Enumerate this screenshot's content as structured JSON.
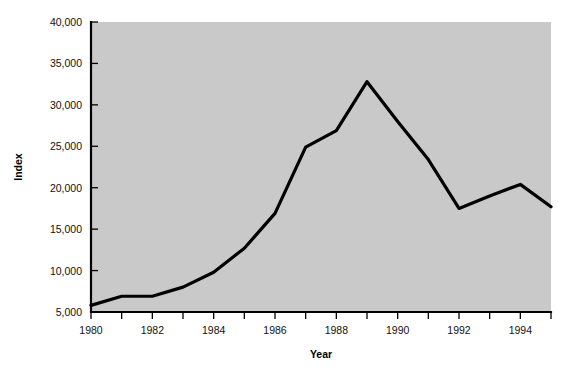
{
  "chart_data": {
    "type": "line",
    "title": "",
    "xlabel": "Year",
    "ylabel": "Index",
    "x": [
      1980,
      1981,
      1982,
      1983,
      1984,
      1985,
      1986,
      1987,
      1988,
      1989,
      1990,
      1991,
      1992,
      1993,
      1994,
      1995
    ],
    "values": [
      5800,
      6900,
      6900,
      8000,
      9800,
      12700,
      16900,
      24900,
      26900,
      32800,
      28000,
      23400,
      17500,
      19000,
      20400,
      17700
    ],
    "series": [
      {
        "name": "Index",
        "values": [
          5800,
          6900,
          6900,
          8000,
          9800,
          12700,
          16900,
          24900,
          26900,
          32800,
          28000,
          23400,
          17500,
          19000,
          20400,
          17700
        ]
      }
    ],
    "xlim": [
      1980,
      1995
    ],
    "ylim": [
      5000,
      40000
    ],
    "ytick_values": [
      5000,
      10000,
      15000,
      20000,
      25000,
      30000,
      35000,
      40000
    ],
    "ytick_labels": [
      "5,000",
      "10,000",
      "15,000",
      "20,000",
      "25,000",
      "30,000",
      "35,000",
      "40,000"
    ],
    "xtick_values": [
      1980,
      1981,
      1982,
      1983,
      1984,
      1985,
      1986,
      1987,
      1988,
      1989,
      1990,
      1991,
      1992,
      1993,
      1994,
      1995
    ],
    "xtick_labels": [
      "1980",
      "",
      "1982",
      "",
      "1984",
      "",
      "1986",
      "",
      "1988",
      "",
      "1990",
      "",
      "1992",
      "",
      "1994",
      ""
    ],
    "grid": false,
    "legend": false,
    "legend_position": "none",
    "plot_background_color": "#c9c9c9",
    "line_color": "#000000",
    "figure_background_color": "#ffffff"
  }
}
